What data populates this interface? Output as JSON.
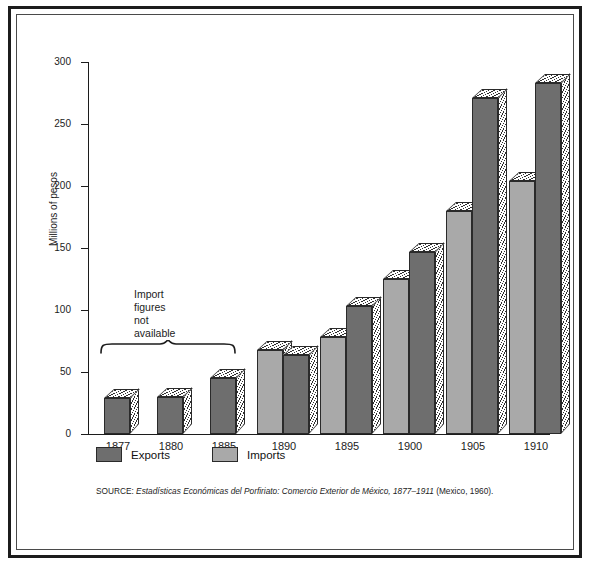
{
  "chart_data": {
    "type": "bar",
    "title": "",
    "xlabel": "",
    "ylabel": "Millions of pesos",
    "ylim": [
      0,
      300
    ],
    "yticks": [
      0,
      50,
      100,
      150,
      200,
      250,
      300
    ],
    "grid": false,
    "legend_position": "bottom-left",
    "categories": [
      "1877",
      "1880",
      "1885",
      "1890",
      "1895",
      "1900",
      "1905",
      "1910"
    ],
    "series": [
      {
        "name": "Exports",
        "color": "#6e6e6e",
        "values": [
          29,
          30,
          45,
          64,
          103,
          147,
          271,
          283
        ]
      },
      {
        "name": "Imports",
        "color": "#a9a9a9",
        "values": [
          null,
          null,
          null,
          68,
          78,
          125,
          180,
          204
        ]
      }
    ],
    "annotations": [
      {
        "text": "Import figures not available",
        "lines": [
          "Import",
          "figures",
          "not",
          "available"
        ],
        "spans_categories": [
          "1877",
          "1885"
        ]
      }
    ],
    "source": "SOURCE: Estadísticas Económicas del Porfiriato: Comercio Exterior de México, 1877–1911 (Mexico, 1960).",
    "source_prefix": "SOURCE: ",
    "source_italic": "Estadísticas Económicas del Porfiriato: Comercio Exterior de México, 1877–1911",
    "source_suffix": " (Mexico, 1960)."
  },
  "axis": {
    "y_label": "Millions of pesos",
    "y_ticks": [
      "300",
      "250",
      "200",
      "150",
      "100",
      "50",
      "0"
    ],
    "x_ticks": [
      "1877",
      "1880",
      "1885",
      "1890",
      "1895",
      "1900",
      "1905",
      "1910"
    ]
  },
  "legend": {
    "items": [
      {
        "label": "Exports",
        "color": "#6e6e6e"
      },
      {
        "label": "Imports",
        "color": "#a9a9a9"
      }
    ]
  },
  "annotation": {
    "line1": "Import",
    "line2": "figures",
    "line3": "not",
    "line4": "available"
  },
  "colors": {
    "exports": "#6e6e6e",
    "imports": "#a9a9a9",
    "axis": "#1c1c1c",
    "frame": "#1c1c1c",
    "background": "#ffffff"
  }
}
